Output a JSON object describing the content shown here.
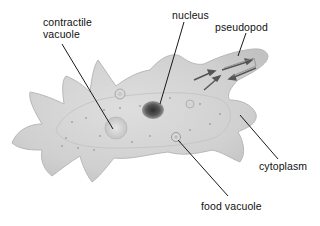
{
  "diagram": {
    "labels": {
      "contractile_vacuole_line1": "contractile",
      "contractile_vacuole_line2": "vacuole",
      "nucleus": "nucleus",
      "pseudopod": "pseudopod",
      "cytoplasm": "cytoplasm",
      "food_vacuole": "food vacuole"
    },
    "colors": {
      "background": "#ffffff",
      "cell_body": "#d4d4d4",
      "cell_edge": "#bdbdbd",
      "nucleus": "#4a4a4a",
      "leader_line": "#1a1a1a",
      "label_text": "#111111"
    }
  }
}
